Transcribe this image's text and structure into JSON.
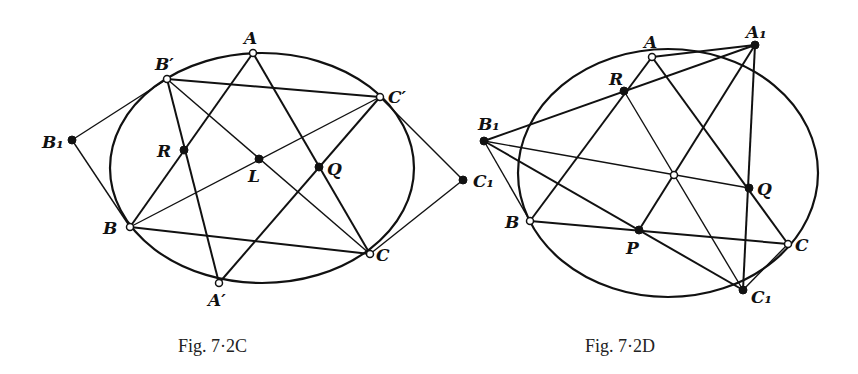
{
  "background_text": [
    "",
    "",
    "",
    "",
    ""
  ],
  "figures": [
    {
      "id": "fig-7-2C",
      "caption": "Fig. 7·2C",
      "ellipse": {
        "cx": 262,
        "cy": 168,
        "rx": 152,
        "ry": 115
      },
      "points": [
        {
          "name": "A",
          "label": "A",
          "x": 253,
          "y": 53,
          "style": "open",
          "lx": 244,
          "ly": 44
        },
        {
          "name": "B-prime",
          "label": "B′",
          "x": 167,
          "y": 79,
          "style": "open",
          "lx": 155,
          "ly": 70
        },
        {
          "name": "C-prime",
          "label": "C′",
          "x": 380,
          "y": 97,
          "style": "open",
          "lx": 388,
          "ly": 103
        },
        {
          "name": "B1",
          "label": "B₁",
          "x": 72,
          "y": 140,
          "style": "fill",
          "lx": 42,
          "ly": 148
        },
        {
          "name": "R",
          "label": "R",
          "x": 184,
          "y": 150,
          "style": "fill",
          "lx": 157,
          "ly": 157
        },
        {
          "name": "L",
          "label": "L",
          "x": 259,
          "y": 159,
          "style": "fill",
          "lx": 248,
          "ly": 182
        },
        {
          "name": "Q",
          "label": "Q",
          "x": 319,
          "y": 167,
          "style": "fill",
          "lx": 327,
          "ly": 175
        },
        {
          "name": "B",
          "label": "B",
          "x": 130,
          "y": 227,
          "style": "open",
          "lx": 103,
          "ly": 234
        },
        {
          "name": "C",
          "label": "C",
          "x": 370,
          "y": 254,
          "style": "open",
          "lx": 376,
          "ly": 261
        },
        {
          "name": "A-prime",
          "label": "A′",
          "x": 219,
          "y": 283,
          "style": "open",
          "lx": 208,
          "ly": 306
        },
        {
          "name": "C1",
          "label": "C₁",
          "x": 463,
          "y": 180,
          "style": "fill",
          "lx": 473,
          "ly": 187
        }
      ],
      "lines": [
        {
          "from": "B-prime",
          "to": "C-prime",
          "w": "line"
        },
        {
          "from": "B",
          "to": "C",
          "w": "line"
        },
        {
          "from": "A",
          "to": "B",
          "w": "line"
        },
        {
          "from": "A",
          "to": "C",
          "w": "line"
        },
        {
          "from": "B-prime",
          "to": "A-prime",
          "w": "line"
        },
        {
          "from": "C-prime",
          "to": "A-prime",
          "w": "line"
        },
        {
          "from": "B-prime",
          "to": "C",
          "w": "thin"
        },
        {
          "from": "B",
          "to": "C-prime",
          "w": "thin"
        },
        {
          "from": "B1",
          "to": "B-prime",
          "w": "thin"
        },
        {
          "from": "B1",
          "to": "B",
          "w": "thin"
        },
        {
          "from": "C1",
          "to": "C-prime",
          "w": "thin"
        },
        {
          "from": "C1",
          "to": "C",
          "w": "thin"
        }
      ]
    },
    {
      "id": "fig-7-2D",
      "caption": "Fig. 7·2D",
      "ellipse": {
        "cx": 668,
        "cy": 173,
        "rx": 150,
        "ry": 124
      },
      "points": [
        {
          "name": "A",
          "label": "A",
          "x": 652,
          "y": 57,
          "style": "open",
          "lx": 644,
          "ly": 48
        },
        {
          "name": "A1",
          "label": "A₁",
          "x": 755,
          "y": 45,
          "style": "fill",
          "lx": 746,
          "ly": 38
        },
        {
          "name": "R",
          "label": "R",
          "x": 624,
          "y": 91,
          "style": "fill",
          "lx": 609,
          "ly": 85
        },
        {
          "name": "B1",
          "label": "B₁",
          "x": 484,
          "y": 141,
          "style": "fill",
          "lx": 478,
          "ly": 130
        },
        {
          "name": "center",
          "label": "",
          "x": 674,
          "y": 175,
          "style": "open",
          "lx": 0,
          "ly": 0
        },
        {
          "name": "Q",
          "label": "Q",
          "x": 749,
          "y": 188,
          "style": "fill",
          "lx": 757,
          "ly": 195
        },
        {
          "name": "B",
          "label": "B",
          "x": 530,
          "y": 221,
          "style": "open",
          "lx": 505,
          "ly": 228
        },
        {
          "name": "P",
          "label": "P",
          "x": 639,
          "y": 230,
          "style": "fill",
          "lx": 626,
          "ly": 254
        },
        {
          "name": "C",
          "label": "C",
          "x": 788,
          "y": 244,
          "style": "open",
          "lx": 795,
          "ly": 251
        },
        {
          "name": "C1",
          "label": "C₁",
          "x": 743,
          "y": 290,
          "style": "fill",
          "lx": 751,
          "ly": 303
        }
      ],
      "lines": [
        {
          "from": "A",
          "to": "A1",
          "w": "line"
        },
        {
          "from": "B1",
          "to": "A1",
          "w": "line"
        },
        {
          "from": "A",
          "to": "B",
          "w": "line"
        },
        {
          "from": "A",
          "to": "C",
          "w": "line"
        },
        {
          "from": "B",
          "to": "C",
          "w": "line"
        },
        {
          "from": "A1",
          "to": "C1",
          "w": "line"
        },
        {
          "from": "A1",
          "to": "P",
          "w": "line"
        },
        {
          "from": "B1",
          "to": "C1",
          "w": "line"
        },
        {
          "from": "B1",
          "to": "Q",
          "w": "thin"
        },
        {
          "from": "R",
          "to": "C1",
          "w": "thin"
        },
        {
          "from": "B1",
          "to": "B",
          "w": "thin"
        },
        {
          "from": "C1",
          "to": "C",
          "w": "thin"
        }
      ]
    }
  ]
}
